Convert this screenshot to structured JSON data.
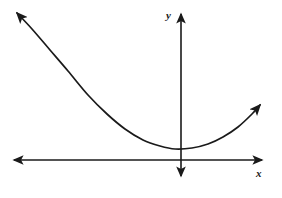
{
  "figure": {
    "kind": "cartesian-plane-parabola-sketch",
    "background_color": "#ffffff",
    "stroke_color": "#1a1a1a",
    "axis_stroke_width": 1.6,
    "curve_stroke_width": 1.7
  },
  "axes": {
    "x_axis": {
      "label": "x",
      "label_color": "#1a1a1a",
      "y_pixel": 160,
      "x_start_pixel": 14,
      "x_end_pixel": 262,
      "arrow_left": true,
      "arrow_right": true
    },
    "y_axis": {
      "label": "y",
      "label_color": "#1a1a1a",
      "x_pixel": 181,
      "y_top_pixel": 14,
      "y_bottom_pixel": 176,
      "arrow_up": true,
      "arrow_down": true
    },
    "origin": {
      "x": 181,
      "y": 160
    }
  },
  "chart_data": {
    "type": "line",
    "title": "",
    "xlabel": "x",
    "ylabel": "y",
    "curve_name": "parabola",
    "opens": "upward",
    "vertex": {
      "x": 175,
      "y": 149
    },
    "arrow_start": true,
    "arrow_end": true,
    "points": [
      {
        "x": 17,
        "y": 13
      },
      {
        "x": 32,
        "y": 29
      },
      {
        "x": 50,
        "y": 50
      },
      {
        "x": 68,
        "y": 71
      },
      {
        "x": 88,
        "y": 95
      },
      {
        "x": 107,
        "y": 114
      },
      {
        "x": 125,
        "y": 129
      },
      {
        "x": 143,
        "y": 140
      },
      {
        "x": 160,
        "y": 146
      },
      {
        "x": 175,
        "y": 149
      },
      {
        "x": 192,
        "y": 148
      },
      {
        "x": 208,
        "y": 144
      },
      {
        "x": 223,
        "y": 137
      },
      {
        "x": 238,
        "y": 127
      },
      {
        "x": 252,
        "y": 114
      },
      {
        "x": 260,
        "y": 105
      }
    ],
    "grid": false,
    "legend": false,
    "xlim": [
      0,
      282
    ],
    "ylim": [
      198,
      0
    ]
  }
}
